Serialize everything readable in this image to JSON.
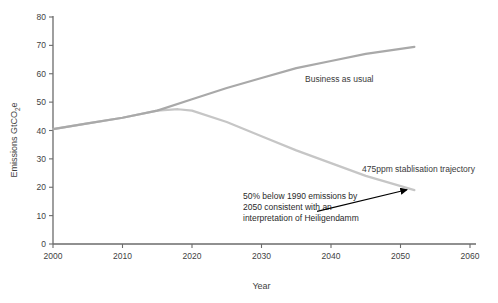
{
  "chart_data": {
    "type": "line",
    "title": "",
    "xlabel": "Year",
    "ylabel": "Emissions GtCO2e",
    "ylabel_parts": {
      "pre": "Emissions GtCO",
      "sub": "2",
      "post": "e"
    },
    "xlim": [
      2000,
      2060
    ],
    "ylim": [
      0,
      80
    ],
    "xticks": [
      2000,
      2010,
      2020,
      2030,
      2040,
      2050,
      2060
    ],
    "xtick_labels": [
      "2000",
      "2010",
      "2020",
      "2030",
      "2040",
      "2050",
      "2060"
    ],
    "yticks": [
      0,
      10,
      20,
      30,
      40,
      50,
      60,
      70,
      80
    ],
    "ytick_labels": [
      "0",
      "10",
      "20",
      "30",
      "40",
      "50",
      "60",
      "70",
      "80"
    ],
    "grid": false,
    "legend_position": "inline-labels",
    "series": [
      {
        "name": "Business as usual",
        "color": "#a9a9a9",
        "label_text": "Business as usual",
        "x": [
          2000,
          2005,
          2010,
          2015,
          2020,
          2025,
          2030,
          2035,
          2040,
          2045,
          2052
        ],
        "values": [
          40.5,
          42.5,
          44.5,
          47.0,
          51.0,
          55.0,
          58.5,
          62.0,
          64.5,
          67.0,
          69.5
        ]
      },
      {
        "name": "475ppm stablisation trajectory",
        "color": "#c6c6c6",
        "label_text": "475ppm stablisation trajectory",
        "x": [
          2000,
          2005,
          2010,
          2015,
          2018,
          2020,
          2025,
          2030,
          2035,
          2040,
          2045,
          2052
        ],
        "values": [
          40.5,
          42.5,
          44.5,
          47.0,
          47.5,
          47.0,
          43.0,
          38.0,
          33.0,
          28.5,
          24.0,
          19.0
        ]
      }
    ],
    "annotations": [
      {
        "name": "heiligendamm-note",
        "lines": [
          "50% below 1990 emissions by",
          "2050 consistent with an",
          "interpretation of Heiligendamm"
        ],
        "arrow_from": [
          2038.0,
          11.5
        ],
        "arrow_to": [
          2051.5,
          19.5
        ],
        "arrow_color": "#000000"
      }
    ]
  },
  "axis_color": "#6b6b6b",
  "background": "#ffffff"
}
